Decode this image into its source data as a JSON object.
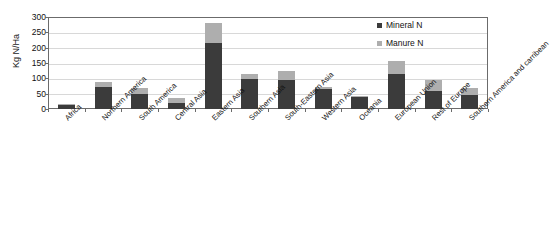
{
  "chart_data": {
    "type": "bar",
    "stacked": true,
    "title": "",
    "xlabel": "",
    "ylabel": "Kg N/Ha",
    "ylim": [
      0,
      300
    ],
    "yticks": [
      0,
      50,
      100,
      150,
      200,
      250,
      300
    ],
    "ytick_labels": [
      "0",
      "50",
      "100",
      "150",
      "200",
      "250",
      "300"
    ],
    "grid": true,
    "legend_position": "top-right",
    "categories": [
      "Africa",
      "Northern America",
      "South America",
      "Central Asia",
      "Eastern Asia",
      "Southern Asia",
      "South-Eastern Asia",
      "Western Asia",
      "Oceania",
      "European Union",
      "Rest of Europe",
      "Southern America and carribean"
    ],
    "series": [
      {
        "name": "Mineral N",
        "color": "#3b3b3b",
        "values": [
          13,
          72,
          48,
          21,
          215,
          97,
          93,
          65,
          38,
          113,
          60,
          46
        ]
      },
      {
        "name": "Manure N",
        "color": "#aeaeae",
        "values": [
          4,
          17,
          20,
          15,
          65,
          16,
          30,
          8,
          6,
          44,
          36,
          23
        ]
      }
    ],
    "totals": [
      17,
      89,
      68,
      36,
      280,
      113,
      123,
      73,
      44,
      157,
      96,
      69
    ]
  },
  "legend": {
    "items": [
      {
        "label": "Mineral N",
        "color": "#3b3b3b"
      },
      {
        "label": "Manure N",
        "color": "#aeaeae"
      }
    ]
  },
  "axis": {
    "y_title": "Kg N/Ha"
  }
}
